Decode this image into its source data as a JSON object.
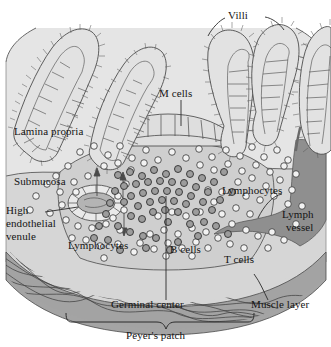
{
  "figure": {
    "background_color": "#ffffff",
    "palette": {
      "tissue_lamina": "#e3e3e3",
      "tissue_submucosa": "#d4d4d4",
      "follicle_fill": "#cfcfcf",
      "epithelium_fill": "#dcdcdc",
      "muscle_layer": "#a8a8a8",
      "lymph_vessel": "#8f8f8f",
      "cell_light": "#efefef",
      "cell_dark": "#9a9a9a",
      "outline": "#3a3a3a",
      "text": "#141414"
    }
  },
  "labels": {
    "villi": "Villi",
    "m_cells": "M cells",
    "lamina_propria": "Lamina propria",
    "submucosa": "Submucosa",
    "high_endothelial_venule_line1": "High",
    "high_endothelial_venule_line2": "endothelial",
    "high_endothelial_venule_line3": "venule",
    "lymphocytes_left": "Lymphocytes",
    "lymphocytes_right": "Lymphocytes",
    "b_cells": "B cells",
    "t_cells": "T cells",
    "lymph_vessel_line1": "Lymph",
    "lymph_vessel_line2": "vessel",
    "germinal_center": "Germinal center",
    "muscle_layer": "Muscle layer",
    "peyers_patch": "Peyer's patch"
  },
  "structures": [
    {
      "name": "villus",
      "count": 5,
      "description": "finger-like epithelial projections with brush border"
    },
    {
      "name": "m-cell-dome",
      "count": 1,
      "description": "flattened follicle-associated epithelium between villi"
    },
    {
      "name": "high-endothelial-venule",
      "count": 1,
      "description": "oval vessel with cuboidal endothelium"
    },
    {
      "name": "lymph-vessel",
      "count": 1,
      "description": "dark branching lymphatic channel at right"
    },
    {
      "name": "germinal-center",
      "count": 1,
      "description": "dense dark cell cluster within follicle"
    },
    {
      "name": "muscle-layer",
      "count": 1,
      "description": "dark curved band with wavy fibers at base"
    }
  ],
  "leader_lines": [
    {
      "from": "villi",
      "to": "villus-4"
    },
    {
      "from": "villi",
      "to": "villus-5"
    },
    {
      "from": "m_cells",
      "to": "m-cell-dome"
    },
    {
      "from": "high_endothelial_venule",
      "to": "high-endothelial-venule"
    },
    {
      "from": "lymph_vessel",
      "to": "lymph-vessel"
    },
    {
      "from": "germinal_center",
      "to": "germinal-center"
    },
    {
      "from": "muscle_layer",
      "to": "muscle-layer"
    }
  ],
  "brackets": [
    {
      "name": "peyers-patch-bracket",
      "label": "Peyer's patch"
    }
  ]
}
